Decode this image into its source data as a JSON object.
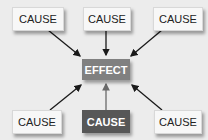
{
  "diagram": {
    "effect": {
      "label": "EFFECT"
    },
    "causes": [
      {
        "label": "CAUSE",
        "position": "top-left"
      },
      {
        "label": "CAUSE",
        "position": "top-center"
      },
      {
        "label": "CAUSE",
        "position": "top-right"
      },
      {
        "label": "CAUSE",
        "position": "bottom-left"
      },
      {
        "label": "CAUSE",
        "position": "bottom-center",
        "highlighted": true
      },
      {
        "label": "CAUSE",
        "position": "bottom-right"
      }
    ],
    "colors": {
      "background": "#ececec",
      "cause_box": "#f7f7f7",
      "effect_box": "#808080",
      "highlighted_cause": "#575757",
      "arrow": "#1a1a1a",
      "arrow_highlighted": "#6a6a6a"
    }
  }
}
